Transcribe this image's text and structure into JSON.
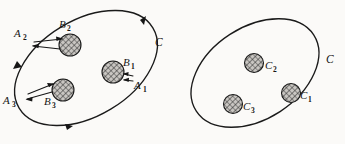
{
  "figure": {
    "background_color": "#fbfaf8",
    "ink_color": "#1a1a1a",
    "width": 345,
    "height": 144
  },
  "left_region": {
    "curve_label": "C",
    "boundary_points": [
      {
        "label": "A",
        "sub": "1"
      },
      {
        "label": "A",
        "sub": "2"
      },
      {
        "label": "A",
        "sub": "3"
      }
    ],
    "disks": [
      {
        "label": "B",
        "sub": "1"
      },
      {
        "label": "B",
        "sub": "2"
      },
      {
        "label": "B",
        "sub": "3"
      }
    ]
  },
  "right_region": {
    "curve_label": "C",
    "disks": [
      {
        "label": "C",
        "sub": "1"
      },
      {
        "label": "C",
        "sub": "2"
      },
      {
        "label": "C",
        "sub": "3"
      }
    ]
  }
}
